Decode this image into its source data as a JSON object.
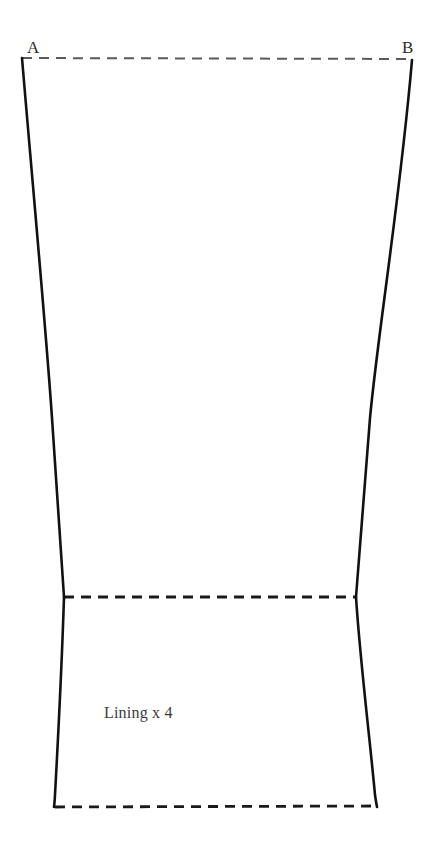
{
  "sheet": {
    "background_color": "#ffffff",
    "width": 432,
    "height": 854
  },
  "pattern": {
    "piece_caption": "Lining x 4",
    "corner_labels": {
      "top_left": "A",
      "top_right": "B"
    },
    "solid_stroke_color": "#111111",
    "dashed_stroke_color": "#1a1a1a",
    "top_dashed_stroke_color": "#5a5a5a",
    "geometry": {
      "top_left": [
        22,
        58
      ],
      "top_right": [
        412,
        60
      ],
      "waist_left": [
        64,
        597
      ],
      "waist_right": [
        356,
        597
      ],
      "hem_left": [
        54,
        807
      ],
      "hem_right": [
        377,
        807
      ],
      "left_edge_mid": [
        52,
        415
      ],
      "right_edge_mid": [
        370,
        415
      ]
    },
    "lines": {
      "top_edge_style": "dashed",
      "waist_line_style": "dashed",
      "hem_edge_style": "dashed",
      "side_seams_style": "solid"
    }
  }
}
